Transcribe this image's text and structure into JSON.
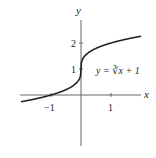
{
  "chart_data": {
    "type": "line",
    "title": "",
    "xlabel": "x",
    "ylabel": "y",
    "annotation": "y = ∛x + 1",
    "x_ticks": [
      {
        "value": -1,
        "label": "−1"
      },
      {
        "value": 1,
        "label": "1"
      }
    ],
    "y_ticks": [
      {
        "value": 1,
        "label": "1"
      },
      {
        "value": 2,
        "label": "2"
      }
    ],
    "xlim": [
      -2.0,
      2.0
    ],
    "ylim": [
      -2.9,
      2.9
    ],
    "grid": false,
    "series": [
      {
        "name": "y = ∛x + 1",
        "function": "cbrt(x)+1",
        "x_range": [
          -2.0,
          2.0
        ],
        "points": [
          [
            -2.0,
            -0.26
          ],
          [
            -1.0,
            0.0
          ],
          [
            -0.125,
            0.5
          ],
          [
            0,
            1
          ],
          [
            0.125,
            1.5
          ],
          [
            1.0,
            2.0
          ],
          [
            2.0,
            2.26
          ]
        ]
      }
    ],
    "colors": {
      "curve": "#222222",
      "axes": "#555555"
    }
  }
}
